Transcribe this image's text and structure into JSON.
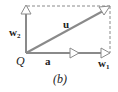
{
  "diagram": {
    "type": "vector-decomposition",
    "origin_label": "Q",
    "vectors": {
      "u": "u",
      "a": "a",
      "w1": "w",
      "w1_sub": "1",
      "w2": "w",
      "w2_sub": "2"
    },
    "caption": "(b)",
    "colors": {
      "vector": "#8a8a8a",
      "dashed": "#8a8a8a",
      "text": "#222222"
    }
  }
}
